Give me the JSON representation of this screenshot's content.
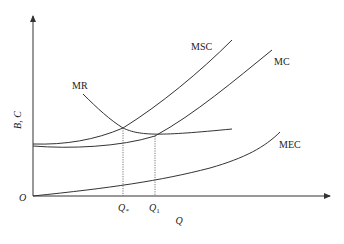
{
  "diagram": {
    "type": "economics-externality-diagram",
    "axes": {
      "y_label": "B, C",
      "x_label": "Q",
      "origin_label": "O"
    },
    "curves": [
      {
        "id": "MSC",
        "label": "MSC",
        "description": "Marginal social cost, upward sloping, steeper"
      },
      {
        "id": "MC",
        "label": "MC",
        "description": "Marginal private cost, upward sloping"
      },
      {
        "id": "MR",
        "label": "MR",
        "description": "Marginal revenue, downward sloping"
      },
      {
        "id": "MEC",
        "label": "MEC",
        "description": "Marginal external cost, convex rising from origin"
      }
    ],
    "x_ticks": [
      {
        "id": "Qstar",
        "label_main": "Q",
        "label_sub": "*",
        "note": "Social optimum where MR = MSC"
      },
      {
        "id": "Q1",
        "label_main": "Q",
        "label_sub": "1",
        "note": "Private optimum where MR = MC"
      }
    ],
    "colors": {
      "line": "#333333",
      "background": "#ffffff"
    }
  }
}
